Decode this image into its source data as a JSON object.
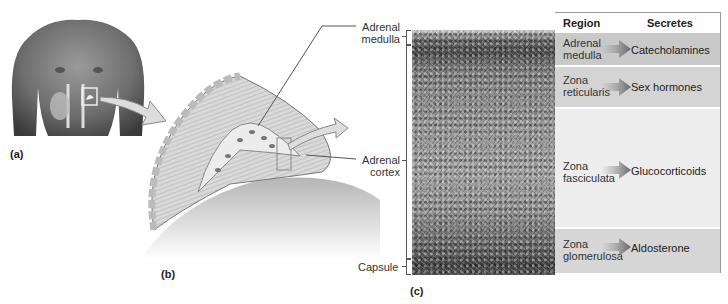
{
  "figure": {
    "panels": {
      "a": "(a)",
      "b": "(b)",
      "c": "(c)"
    },
    "diagram_labels": {
      "adrenal_medulla": [
        "Adrenal",
        "medulla"
      ],
      "adrenal_cortex": [
        "Adrenal",
        "cortex"
      ],
      "capsule": "Capsule"
    },
    "table": {
      "headers": {
        "region": "Region",
        "secretes": "Secretes"
      },
      "rows": [
        {
          "region": [
            "Adrenal",
            "medulla"
          ],
          "secretes": "Catecholamines",
          "bg": "#c9c9c9"
        },
        {
          "region": [
            "Zona",
            "reticularis"
          ],
          "secretes": "Sex hormones",
          "bg": "#d4d4d4"
        },
        {
          "region": [
            "Zona",
            "fasciculata"
          ],
          "secretes": "Glucocorticoids",
          "bg": "#ededed"
        },
        {
          "region": [
            "Zona",
            "glomerulosa"
          ],
          "secretes": "Aldosterone",
          "bg": "#d6d6d6"
        }
      ]
    }
  }
}
